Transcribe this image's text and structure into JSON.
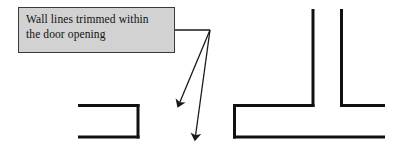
{
  "figure": {
    "canvas": {
      "width": 404,
      "height": 150,
      "background": "#ffffff"
    },
    "callout": {
      "text": "Wall lines trimmed within\nthe door opening",
      "line1": "Wall lines trimmed within",
      "line2": "the door opening",
      "fill_color": "#d2d2d2",
      "border_color": "#3a3a3a",
      "text_color": "#111111",
      "box": {
        "x": 18,
        "y": 7,
        "width": 157,
        "height": 46
      }
    },
    "leader": {
      "stroke_color": "#1a1a1a",
      "stroke_width": 1.2,
      "horizontal_from": {
        "x": 175,
        "y": 30
      },
      "junction": {
        "x": 210,
        "y": 30
      },
      "arrows": [
        {
          "name": "arrow-to-left-wall",
          "from": {
            "x": 210,
            "y": 30
          },
          "to": {
            "x": 179,
            "y": 104
          }
        },
        {
          "name": "arrow-to-right-wall",
          "from": {
            "x": 210,
            "y": 30
          },
          "to": {
            "x": 195,
            "y": 138
          }
        }
      ]
    },
    "left_wall": {
      "label": "wall-opening-left",
      "stroke_color": "#111111",
      "stroke_width": 3,
      "segments": [
        {
          "name": "top-wall-line",
          "x1": 78,
          "y1": 105,
          "x2": 139,
          "y2": 105
        },
        {
          "name": "end-cap-line",
          "x1": 138,
          "y1": 104,
          "x2": 138,
          "y2": 138
        },
        {
          "name": "bottom-wall-line",
          "x1": 78,
          "y1": 137,
          "x2": 139,
          "y2": 137
        }
      ]
    },
    "right_wall": {
      "label": "wall-tee-junction",
      "stroke_color": "#111111",
      "stroke_width": 3,
      "segments": [
        {
          "name": "left-vertical-cap",
          "x1": 234,
          "y1": 104,
          "x2": 234,
          "y2": 138
        },
        {
          "name": "upper-horizontal-left",
          "x1": 233,
          "y1": 105,
          "x2": 314,
          "y2": 105
        },
        {
          "name": "branch-vertical-left",
          "x1": 313,
          "y1": 9,
          "x2": 313,
          "y2": 106
        },
        {
          "name": "branch-vertical-right",
          "x1": 341,
          "y1": 9,
          "x2": 341,
          "y2": 106
        },
        {
          "name": "upper-horizontal-right",
          "x1": 340,
          "y1": 105,
          "x2": 385,
          "y2": 105
        },
        {
          "name": "bottom-horizontal",
          "x1": 233,
          "y1": 137,
          "x2": 385,
          "y2": 137
        }
      ]
    }
  }
}
